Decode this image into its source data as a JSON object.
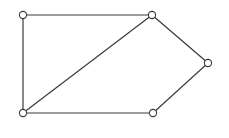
{
  "diagram": {
    "type": "undirected-graph",
    "node_count": 5,
    "edge_count": 6,
    "nodes": [
      {
        "id": "A",
        "label": ""
      },
      {
        "id": "B",
        "label": ""
      },
      {
        "id": "C",
        "label": ""
      },
      {
        "id": "D",
        "label": ""
      },
      {
        "id": "E",
        "label": ""
      }
    ],
    "edges": [
      {
        "from": "A",
        "to": "B"
      },
      {
        "from": "A",
        "to": "D"
      },
      {
        "from": "B",
        "to": "D"
      },
      {
        "from": "B",
        "to": "C"
      },
      {
        "from": "C",
        "to": "E"
      },
      {
        "from": "D",
        "to": "E"
      }
    ],
    "colors": {
      "stroke": "#3a3a3a",
      "node_fill": "#ffffff",
      "background": "#ffffff"
    }
  }
}
